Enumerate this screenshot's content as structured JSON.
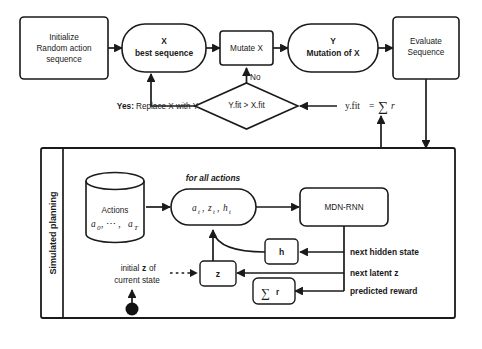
{
  "diagram": {
    "colors": {
      "stroke": "#1a1a1a",
      "fill": "#ffffff",
      "background": "#ffffff",
      "dot": "#121212"
    },
    "top_flow": {
      "initialize": {
        "line1": "Initialize",
        "line2": "Random action",
        "line3": "sequence"
      },
      "best_sequence": {
        "line1": "X",
        "line2": "best sequence"
      },
      "mutate": {
        "label": "Mutate X"
      },
      "mutation_of_x": {
        "line1": "Y",
        "line2": "Mutation of X"
      },
      "evaluate": {
        "line1": "Evaluate",
        "line2": "Sequence"
      },
      "decision": {
        "label": "Y.fit > X.fit"
      },
      "edge_no": "No",
      "edge_yes_prefix": "Yes:",
      "edge_yes_text": "Replace X with Y",
      "fitness_expr": {
        "lhs": "y.fit",
        "eq": "=",
        "sigma": "∑",
        "rhs": "r"
      }
    },
    "planning_panel": {
      "side_label": "Simulated planning",
      "actions_store": {
        "line1": "Actions",
        "line2_a": "a",
        "line2_sub0": "0",
        "line2_dots": ",  ⋯  ,",
        "line2_b": "a",
        "line2_subT": "T"
      },
      "for_all_actions_label": "for all actions",
      "state_tuple": {
        "a": "a",
        "a_sub": "t",
        "z": "z",
        "z_sub": "t",
        "h": "h",
        "h_sub": "t",
        "sep": ","
      },
      "mdn_rnn": {
        "label": "MDN-RNN"
      },
      "hidden_box": {
        "label": "h"
      },
      "latent_box": {
        "label": "z"
      },
      "reward_box": {
        "sigma": "∑",
        "r": "r"
      },
      "edge_labels": {
        "next_hidden_state": "next hidden state",
        "next_latent_z": "next latent z",
        "predicted_reward": "predicted reward"
      },
      "initial_state_note": {
        "line1_a": "initial",
        "line1_b": "z",
        "line1_c": "of",
        "line2": "current state"
      }
    }
  }
}
